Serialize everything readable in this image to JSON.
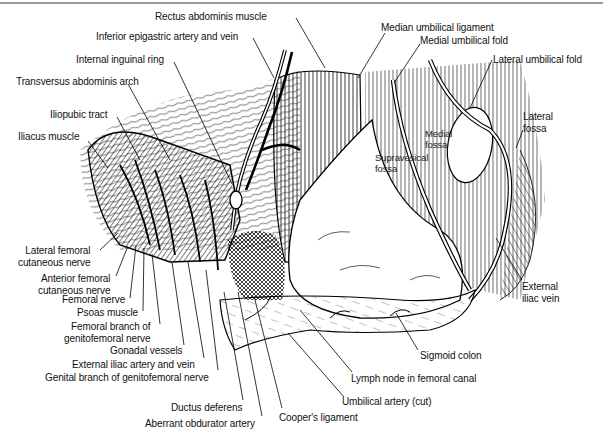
{
  "figure": {
    "type": "anatomical-illustration",
    "labels": [
      {
        "id": "rectus",
        "text": "Rectus abdominis muscle",
        "x": 155,
        "y": 11,
        "anchor": "left"
      },
      {
        "id": "inf_epigastric",
        "text": "Inferior epigastric artery and vein",
        "x": 96,
        "y": 31,
        "anchor": "left"
      },
      {
        "id": "int_ring",
        "text": "Internal inguinal ring",
        "x": 76,
        "y": 54,
        "anchor": "left"
      },
      {
        "id": "transversus",
        "text": "Transversus abdominis arch",
        "x": 16,
        "y": 76,
        "anchor": "left"
      },
      {
        "id": "iliopubic",
        "text": "Iliopubic tract",
        "x": 50,
        "y": 109,
        "anchor": "left"
      },
      {
        "id": "iliacus",
        "text": "Iliacus muscle",
        "x": 18,
        "y": 131,
        "anchor": "left"
      },
      {
        "id": "median_umb_lig",
        "text": "Median umbilical ligament",
        "x": 381,
        "y": 22,
        "anchor": "left"
      },
      {
        "id": "medial_umb_fold",
        "text": "Medial umbilical fold",
        "x": 420,
        "y": 35,
        "anchor": "left"
      },
      {
        "id": "lateral_umb_fold",
        "text": "Lateral umbilical fold",
        "x": 493,
        "y": 54,
        "anchor": "left"
      },
      {
        "id": "lateral_fossa",
        "text": "Lateral\nfossa",
        "x": 523,
        "y": 111,
        "anchor": "left"
      },
      {
        "id": "medial_fossa",
        "text": "Medial\nfossa",
        "x": 425,
        "y": 128,
        "anchor": "left",
        "in_art": true
      },
      {
        "id": "supravesical_fossa",
        "text": "Supravesical\nfossa",
        "x": 375,
        "y": 152,
        "anchor": "left",
        "in_art": true
      },
      {
        "id": "ext_iliac_vein",
        "text": "External\niliac vein",
        "x": 522,
        "y": 281,
        "anchor": "left"
      },
      {
        "id": "lat_fem_cut",
        "text": "Lateral femoral\ncutaneous nerve",
        "x": 18,
        "y": 245,
        "anchor": "left"
      },
      {
        "id": "ant_fem_cut",
        "text": "Anterior femoral\ncutaneous nerve",
        "x": 38,
        "y": 273,
        "anchor": "left"
      },
      {
        "id": "femoral_nerve",
        "text": "Femoral nerve",
        "x": 62,
        "y": 294,
        "anchor": "left"
      },
      {
        "id": "psoas",
        "text": "Psoas muscle",
        "x": 77,
        "y": 307,
        "anchor": "left"
      },
      {
        "id": "fem_branch_gf",
        "text": "Femoral branch of\ngenitofemoral nerve",
        "x": 64,
        "y": 321,
        "anchor": "left"
      },
      {
        "id": "gonadal",
        "text": "Gonadal vessels",
        "x": 110,
        "y": 345,
        "anchor": "left"
      },
      {
        "id": "ext_iliac_av",
        "text": "External iliac artery and vein",
        "x": 72,
        "y": 359,
        "anchor": "left"
      },
      {
        "id": "genital_branch_gf",
        "text": "Genital branch of genitofemoral nerve",
        "x": 45,
        "y": 372,
        "anchor": "left"
      },
      {
        "id": "ductus",
        "text": "Ductus deferens",
        "x": 171,
        "y": 402,
        "anchor": "left"
      },
      {
        "id": "aberrant_obt",
        "text": "Aberrant obdurator artery",
        "x": 145,
        "y": 418,
        "anchor": "left"
      },
      {
        "id": "coopers",
        "text": "Cooper's ligament",
        "x": 279,
        "y": 412,
        "anchor": "left"
      },
      {
        "id": "umbilical_artery",
        "text": "Umbilical artery (cut)",
        "x": 342,
        "y": 396,
        "anchor": "left"
      },
      {
        "id": "lymph_node",
        "text": "Lymph node in femoral canal",
        "x": 351,
        "y": 373,
        "anchor": "left"
      },
      {
        "id": "sigmoid",
        "text": "Sigmoid colon",
        "x": 420,
        "y": 350,
        "anchor": "left"
      }
    ],
    "leaders": [
      {
        "id": "rectus",
        "x1": 296,
        "y1": 18,
        "x2": 325,
        "y2": 68
      },
      {
        "id": "inf_epigastric",
        "x1": 253,
        "y1": 38,
        "x2": 274,
        "y2": 78
      },
      {
        "id": "int_ring",
        "x1": 174,
        "y1": 62,
        "x2": 232,
        "y2": 184
      },
      {
        "id": "transversus",
        "x1": 128,
        "y1": 84,
        "x2": 170,
        "y2": 160
      },
      {
        "id": "iliopubic",
        "x1": 117,
        "y1": 117,
        "x2": 140,
        "y2": 160
      },
      {
        "id": "iliacus",
        "x1": 88,
        "y1": 141,
        "x2": 108,
        "y2": 168
      },
      {
        "id": "median_umb_lig",
        "x1": 385,
        "y1": 33,
        "x2": 358,
        "y2": 78
      },
      {
        "id": "medial_umb_fold",
        "x1": 420,
        "y1": 44,
        "x2": 394,
        "y2": 83
      },
      {
        "id": "lateral_umb_fold",
        "x1": 492,
        "y1": 60,
        "x2": 470,
        "y2": 108
      },
      {
        "id": "lateral_fossa",
        "x1": 523,
        "y1": 130,
        "x2": 516,
        "y2": 148
      },
      {
        "id": "ext_iliac_vein",
        "x1": 522,
        "y1": 280,
        "x2": 496,
        "y2": 238
      },
      {
        "id": "lat_fem_cut",
        "x1": 100,
        "y1": 250,
        "x2": 118,
        "y2": 233
      },
      {
        "id": "ant_fem_cut",
        "x1": 116,
        "y1": 276,
        "x2": 128,
        "y2": 246
      },
      {
        "id": "femoral_nerve",
        "x1": 130,
        "y1": 298,
        "x2": 136,
        "y2": 246
      },
      {
        "id": "psoas",
        "x1": 143,
        "y1": 311,
        "x2": 144,
        "y2": 248
      },
      {
        "id": "fem_branch_gf",
        "x1": 160,
        "y1": 324,
        "x2": 152,
        "y2": 254
      },
      {
        "id": "gonadal",
        "x1": 184,
        "y1": 345,
        "x2": 172,
        "y2": 262
      },
      {
        "id": "ext_iliac_av",
        "x1": 204,
        "y1": 358,
        "x2": 188,
        "y2": 262
      },
      {
        "id": "genital_branch_gf",
        "x1": 218,
        "y1": 370,
        "x2": 206,
        "y2": 270
      },
      {
        "id": "ductus",
        "x1": 243,
        "y1": 400,
        "x2": 224,
        "y2": 292
      },
      {
        "id": "aberrant_obt",
        "x1": 262,
        "y1": 416,
        "x2": 238,
        "y2": 292
      },
      {
        "id": "coopers",
        "x1": 282,
        "y1": 408,
        "x2": 254,
        "y2": 296
      },
      {
        "id": "umbilical_artery",
        "x1": 344,
        "y1": 397,
        "x2": 288,
        "y2": 333
      },
      {
        "id": "lymph_node",
        "x1": 352,
        "y1": 372,
        "x2": 300,
        "y2": 310
      },
      {
        "id": "sigmoid",
        "x1": 418,
        "y1": 350,
        "x2": 396,
        "y2": 313
      }
    ]
  }
}
